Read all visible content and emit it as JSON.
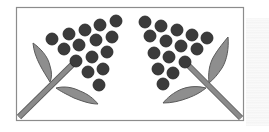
{
  "illustration": {
    "description": "Two mirrored sprigs of dark berries with leaves inside a rectangular frame",
    "size": {
      "width": 269,
      "height": 132
    },
    "colors": {
      "background": "#ffffff",
      "frame": "#8c8c8c",
      "berry_fill": "#3b3b3b",
      "berry_edge": "#222222",
      "leaf_fill": "#8e8e8e",
      "leaf_edge": "#5a5a5a",
      "stem_fill": "#8a8a8a",
      "stem_edge": "#5c5c5c",
      "texture": "#f2f2f2"
    },
    "frame": {
      "x": 16,
      "y": 7,
      "width": 227,
      "height": 113
    },
    "left_sprig": {
      "berry_count": 15,
      "berries": [
        [
          52,
          39
        ],
        [
          69,
          34
        ],
        [
          85,
          30
        ],
        [
          100,
          25
        ],
        [
          116,
          21
        ],
        [
          64,
          49
        ],
        [
          79,
          45
        ],
        [
          96,
          40
        ],
        [
          112,
          37
        ],
        [
          76,
          61
        ],
        [
          92,
          57
        ],
        [
          107,
          52
        ],
        [
          88,
          72
        ],
        [
          103,
          69
        ],
        [
          99,
          85
        ]
      ],
      "berry_radius": 6,
      "stem": {
        "from": [
          19,
          117
        ],
        "to": [
          76,
          61
        ]
      },
      "leaves": [
        {
          "name": "upper-leaf",
          "path": "M50,82 C44,72 34,58 33,43 C40,48 48,56 50,66 C52,72 52,78 50,82 Z"
        },
        {
          "name": "lower-leaf",
          "path": "M56,88 C64,86 72,87 80,91 C88,94 94,99 98,104 C90,104 82,101 74,98 C66,94 60,91 56,88 Z"
        }
      ]
    },
    "right_sprig": {
      "berry_count": 15,
      "berries": [
        [
          145,
          22
        ],
        [
          161,
          26
        ],
        [
          177,
          30
        ],
        [
          192,
          35
        ],
        [
          207,
          38
        ],
        [
          150,
          36
        ],
        [
          166,
          41
        ],
        [
          181,
          46
        ],
        [
          197,
          49
        ],
        [
          154,
          53
        ],
        [
          169,
          57
        ],
        [
          185,
          62
        ],
        [
          158,
          69
        ],
        [
          173,
          73
        ],
        [
          163,
          84
        ]
      ],
      "berry_radius": 6,
      "stem": {
        "from": [
          185,
          62
        ],
        "to": [
          241,
          118
        ]
      },
      "leaves": [
        {
          "name": "upper-leaf",
          "path": "M209,83 C208,74 209,64 214,56 C218,49 224,42 228,37 C229,48 227,60 222,68 C218,74 214,79 209,83 Z"
        },
        {
          "name": "lower-leaf",
          "path": "M206,88 C198,86 190,86 182,89 C174,92 167,98 163,103 C172,103 180,101 188,98 C196,95 201,92 206,88 Z"
        }
      ]
    }
  }
}
